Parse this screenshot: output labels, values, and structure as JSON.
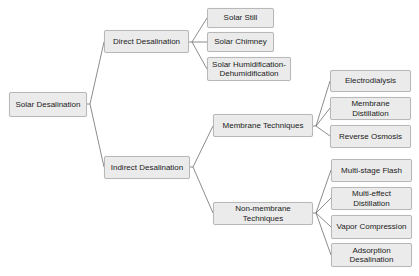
{
  "diagram": {
    "type": "tree",
    "root": {
      "id": "root",
      "label": "Solar Desalination"
    },
    "nodes": {
      "direct": {
        "label": "Direct Desalination",
        "parent": "root"
      },
      "solar_still": {
        "label": "Solar Still",
        "parent": "direct"
      },
      "solar_chimney": {
        "label": "Solar Chimney",
        "parent": "direct"
      },
      "solar_hdh": {
        "label": "Solar Humidification-Dehumidification",
        "parent": "direct"
      },
      "indirect": {
        "label": "Indirect Desalination",
        "parent": "root"
      },
      "membrane": {
        "label": "Membrane Techniques",
        "parent": "indirect"
      },
      "electrodialysis": {
        "label": "Electrodialysis",
        "parent": "membrane"
      },
      "membrane_distillation": {
        "label": "Membrane Distillation",
        "parent": "membrane"
      },
      "reverse_osmosis": {
        "label": "Reverse Osmosis",
        "parent": "membrane"
      },
      "non_membrane": {
        "label": "Non-membrane Techniques",
        "parent": "indirect"
      },
      "msf": {
        "label": "Multi-stage Flash",
        "parent": "non_membrane"
      },
      "med": {
        "label": "Multi-effect Distillation",
        "parent": "non_membrane"
      },
      "vapor": {
        "label": "Vapor Compression",
        "parent": "non_membrane"
      },
      "adsorption": {
        "label": "Adsorption Desalination",
        "parent": "non_membrane"
      }
    },
    "colors": {
      "node_fill": "#ebebeb",
      "node_border": "#b8b8b8",
      "line": "#6e6e6e",
      "text": "#222222"
    }
  }
}
